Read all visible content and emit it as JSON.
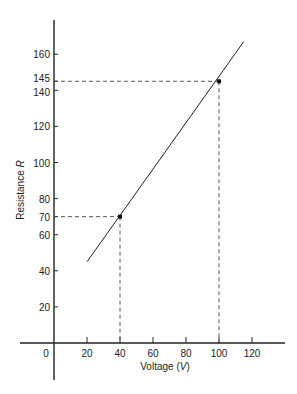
{
  "chart_data": {
    "type": "line",
    "title": "",
    "xlabel": "Voltage (V)",
    "ylabel": "Resistance R",
    "xlabel_text": "Voltage (",
    "xlabel_var": "V",
    "xlabel_close": ")",
    "ylabel_text": "Resistance ",
    "ylabel_var": "R",
    "xlim": [
      -8,
      128
    ],
    "ylim": [
      -25,
      172
    ],
    "x_ticks": [
      0,
      20,
      40,
      60,
      80,
      100,
      120
    ],
    "y_ticks": [
      20,
      40,
      60,
      70,
      80,
      100,
      120,
      140,
      145,
      160
    ],
    "grid": false,
    "series": [
      {
        "name": "Resistance vs Voltage",
        "x": [
          20,
          115
        ],
        "y": [
          45,
          167
        ]
      }
    ],
    "highlighted_points": [
      {
        "x": 40,
        "y": 70
      },
      {
        "x": 100,
        "y": 145
      }
    ],
    "annotations": [
      "dashed guide from (40,70) to axes",
      "dashed guide from (100,145) to axes"
    ]
  }
}
